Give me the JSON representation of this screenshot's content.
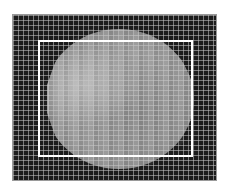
{
  "image": {
    "description": "grayscale pixelated round specimen with grid overlay and region-of-interest rectangle",
    "frame": {
      "border_color": "#9a9a9a",
      "background": "#1c1c1c"
    },
    "specimen": {
      "tone": "#999999",
      "shape": "circle"
    },
    "grid": {
      "cell_size_px": 5,
      "line_color": "#c8c8c8"
    },
    "roi_rectangle": {
      "stroke_color": "#ffffff",
      "stroke_width_px": 2
    }
  }
}
